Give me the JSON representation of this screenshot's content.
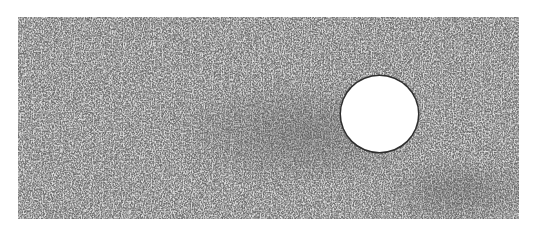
{
  "image": {
    "description": "Grayscale particle flow visualization with a white circular obstacle",
    "background_color": "#6a6a6a",
    "particle_color": "#d8d8d8",
    "obstacle": {
      "shape": "circle",
      "fill": "#ffffff",
      "outline": "#2e2e2e",
      "center_x": 380,
      "center_y": 113,
      "radius": 38
    }
  }
}
